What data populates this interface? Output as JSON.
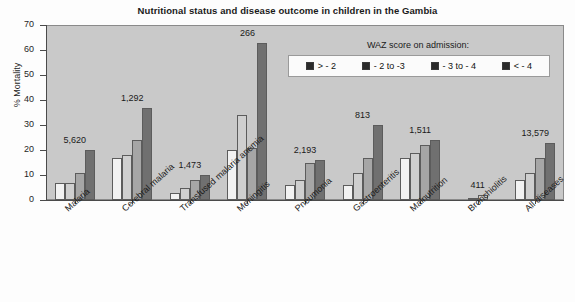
{
  "chart_data": {
    "type": "bar",
    "title": "Nutritional status and disease outcome in children in the Gambia",
    "xlabel": "",
    "ylabel": "% Mortality",
    "ylim": [
      0,
      70
    ],
    "yticks": [
      0,
      10,
      20,
      30,
      40,
      50,
      60,
      70
    ],
    "grid": false,
    "legend_position": "upper-right-inside",
    "legend_title": "WAZ score on admission:",
    "categories": [
      "Malaria",
      "Cerebral malaria",
      "Transfused malaria anemia",
      "Meningitis",
      "Pneumonia",
      "Gastroenteritis",
      "Malnutrition",
      "Bronchiolitis",
      "All diseases"
    ],
    "group_counts": [
      "5,620",
      "1,292",
      "1,473",
      "266",
      "2,193",
      "813",
      "1,511",
      "411",
      "13,579"
    ],
    "series": [
      {
        "name": "> - 2",
        "color": "#f2f2f2",
        "values": [
          7,
          17,
          3,
          20,
          6,
          6,
          17,
          1,
          8
        ]
      },
      {
        "name": "- 2 to -3",
        "color": "#cfcfcf",
        "values": [
          7,
          18,
          5,
          34,
          8,
          11,
          19,
          2,
          11
        ]
      },
      {
        "name": "- 3 to - 4",
        "color": "#a6a6a6",
        "values": [
          11,
          24,
          8,
          21,
          15,
          17,
          22,
          0,
          17
        ]
      },
      {
        "name": "< - 4",
        "color": "#707070",
        "values": [
          20,
          37,
          10,
          63,
          16,
          30,
          24,
          0,
          23
        ]
      }
    ]
  },
  "legend": {
    "title": "WAZ score on admission:",
    "items": [
      {
        "label": "> - 2"
      },
      {
        "label": "- 2 to -3"
      },
      {
        "label": "- 3 to - 4"
      },
      {
        "label": "< - 4"
      }
    ]
  }
}
